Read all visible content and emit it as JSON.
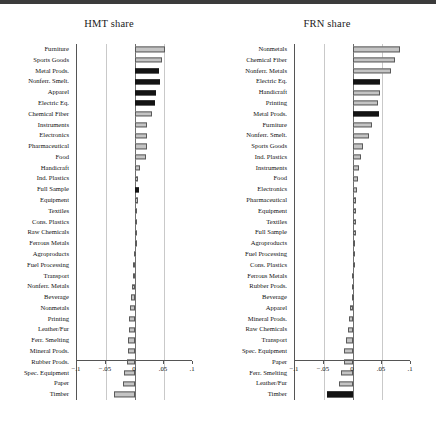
{
  "figure": {
    "background": "#ffffff",
    "bar_fill_gray": "#c4c4c4",
    "bar_fill_black": "#141414",
    "bar_edge": "#5a5a5a"
  },
  "chart_data": [
    {
      "type": "bar",
      "orientation": "horizontal",
      "title": "HMT share",
      "xlabel": "",
      "ylabel": "",
      "xlim": [
        -0.1,
        0.1
      ],
      "grid": true,
      "gridlines": [
        -0.05,
        0.05
      ],
      "zero_reference": 0,
      "legend": "none",
      "tick_labels": [
        "−.1",
        "−.05",
        "0",
        ".05",
        ".1"
      ],
      "tick_values": [
        -0.1,
        -0.05,
        0,
        0.05,
        0.1
      ],
      "categories": [
        "Furniture",
        "Sports Goods",
        "Metal Prods.",
        "Nonferr. Smelt.",
        "Apparel",
        "Electric Eq.",
        "Chemical Fiber",
        "Instruments",
        "Electronics",
        "Pharmaceutical",
        "Food",
        "Handicraft",
        "Ind. Plastics",
        "Full Sample",
        "Equipment",
        "Textiles",
        "Cons. Plastics",
        "Raw Chemicals",
        "Ferrous Metals",
        "Agroproducts",
        "Fuel Processing",
        "Transport",
        "Nonferr. Metals",
        "Beverage",
        "Nonmetals",
        "Printing",
        "Leather/Fur",
        "Ferr. Smelting",
        "Mineral Prods.",
        "Rubber Prods.",
        "Spec. Equipment",
        "Paper",
        "Timber"
      ],
      "values": [
        0.052,
        0.046,
        0.042,
        0.043,
        0.036,
        0.034,
        0.03,
        0.021,
        0.02,
        0.02,
        0.019,
        0.008,
        0.006,
        0.007,
        0.005,
        0.004,
        0.003,
        0.002,
        0.0,
        -0.001,
        -0.003,
        -0.004,
        -0.005,
        -0.007,
        -0.008,
        -0.01,
        -0.01,
        -0.012,
        -0.012,
        -0.013,
        -0.019,
        -0.021,
        -0.036
      ],
      "fills": [
        "gray",
        "gray",
        "black",
        "black",
        "black",
        "black",
        "gray",
        "gray",
        "gray",
        "gray",
        "gray",
        "gray",
        "gray",
        "black",
        "gray",
        "gray",
        "gray",
        "gray",
        "gray",
        "gray",
        "gray",
        "gray",
        "gray",
        "gray",
        "gray",
        "gray",
        "gray",
        "gray",
        "gray",
        "gray",
        "gray",
        "gray",
        "gray"
      ]
    },
    {
      "type": "bar",
      "orientation": "horizontal",
      "title": "FRN share",
      "xlabel": "",
      "ylabel": "",
      "xlim": [
        -0.1,
        0.1
      ],
      "grid": true,
      "gridlines": [
        -0.05,
        0.05
      ],
      "zero_reference": 0,
      "legend": "none",
      "tick_labels": [
        "−.1",
        "−.05",
        "0",
        ".05",
        ".1"
      ],
      "tick_values": [
        -0.1,
        -0.05,
        0,
        0.05,
        0.1
      ],
      "categories": [
        "Nonmetals",
        "Chemical Fiber",
        "Nonferr. Metals",
        "Electric Eq.",
        "Handicraft",
        "Printing",
        "Metal Prods.",
        "Furniture",
        "Nonferr. Smelt.",
        "Sports Goods",
        "Ind. Plastics",
        "Instruments",
        "Food",
        "Electronics",
        "Pharmaceutical",
        "Equipment",
        "Textiles",
        "Full Sample",
        "Agroproducts",
        "Fuel Processing",
        "Cons. Plastics",
        "Ferrous Metals",
        "Rubber Prods.",
        "Beverage",
        "Apparel",
        "Mineral Prods.",
        "Raw Chemicals",
        "Transport",
        "Spec. Equipment",
        "Paper",
        "Ferr. Smelting",
        "Leather/Fur",
        "Timber"
      ],
      "values": [
        0.081,
        0.072,
        0.066,
        0.047,
        0.046,
        0.043,
        0.044,
        0.032,
        0.028,
        0.017,
        0.013,
        0.011,
        0.009,
        0.007,
        0.006,
        0.006,
        0.006,
        0.005,
        0.004,
        0.001,
        0.0,
        -0.001,
        -0.001,
        -0.002,
        -0.005,
        -0.007,
        -0.008,
        -0.012,
        -0.015,
        -0.016,
        -0.021,
        -0.025,
        -0.044
      ],
      "fills": [
        "gray",
        "gray",
        "gray",
        "black",
        "gray",
        "gray",
        "black",
        "gray",
        "gray",
        "gray",
        "gray",
        "gray",
        "gray",
        "gray",
        "gray",
        "gray",
        "gray",
        "gray",
        "gray",
        "gray",
        "gray",
        "gray",
        "gray",
        "gray",
        "gray",
        "gray",
        "gray",
        "gray",
        "gray",
        "gray",
        "gray",
        "gray",
        "black"
      ]
    }
  ]
}
